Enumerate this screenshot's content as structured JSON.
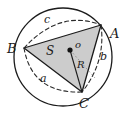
{
  "figure": {
    "kind": "circumscribed-circle-triangle-diagram",
    "background_color": "#ffffff",
    "stroke_color": "#1b1b1b",
    "triangle_fill_color": "#c9c9c9",
    "circle": {
      "center_x": 63,
      "center_y": 57,
      "radius": 49,
      "stroke_width": 1.3
    },
    "center_point": {
      "x": 70,
      "y": 50,
      "dot_radius": 2.6
    },
    "vertices": {
      "A": {
        "x": 101,
        "y": 25
      },
      "B": {
        "x": 24,
        "y": 48
      },
      "C": {
        "x": 82,
        "y": 92
      }
    },
    "radius_segment": {
      "from_x": 70,
      "from_y": 50,
      "to_x": 82,
      "to_y": 92
    },
    "labels": {
      "vertex_a": "A",
      "vertex_b": "B",
      "vertex_c": "C",
      "side_a": "a",
      "side_b": "b",
      "side_c": "c",
      "center": "o",
      "area": "S",
      "radius": "R"
    },
    "label_positions": {
      "vertex_a": {
        "x": 110,
        "y": 27
      },
      "vertex_b": {
        "x": 7,
        "y": 42
      },
      "vertex_c": {
        "x": 79,
        "y": 97
      },
      "side_a": {
        "x": 40,
        "y": 73
      },
      "side_b": {
        "x": 100,
        "y": 51
      },
      "side_c": {
        "x": 44,
        "y": 14
      },
      "center": {
        "x": 75,
        "y": 40
      },
      "area": {
        "x": 46,
        "y": 45
      },
      "radius": {
        "x": 77,
        "y": 60
      }
    }
  }
}
